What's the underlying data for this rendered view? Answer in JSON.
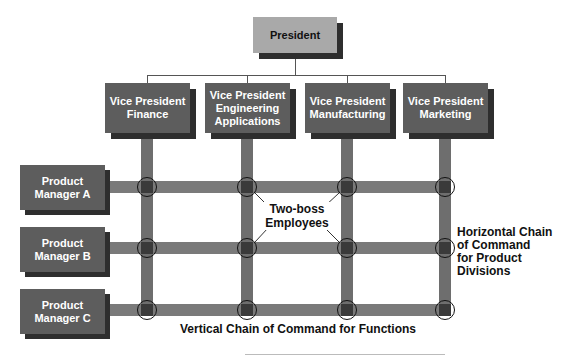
{
  "president": {
    "label": "President"
  },
  "vice_presidents": [
    {
      "label": "Vice President\nFinance"
    },
    {
      "label": "Vice President\nEngineering\nApplications"
    },
    {
      "label": "Vice President\nManufacturing"
    },
    {
      "label": "Vice President\nMarketing"
    }
  ],
  "product_managers": [
    {
      "label": "Product\nManager A"
    },
    {
      "label": "Product\nManager B"
    },
    {
      "label": "Product\nManager C"
    }
  ],
  "annotations": {
    "two_boss": "Two-boss\nEmployees",
    "horizontal_chain": "Horizontal Chain\nof Command\nfor Product\nDivisions",
    "vertical_chain": "Vertical Chain of Command for Functions"
  },
  "colors": {
    "president_fill": "#a9a9a9",
    "box_fill": "#5d5d5d",
    "shadow": "#2e2e2e",
    "bar": "#707070",
    "node": "#3a3a3a"
  }
}
